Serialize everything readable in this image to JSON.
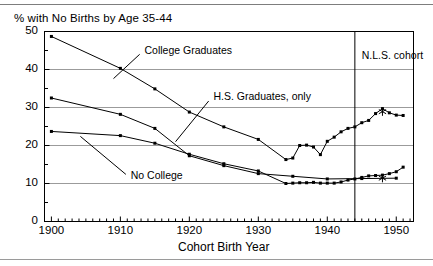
{
  "chart_data": {
    "type": "line",
    "title": "% with No Births by Age 35-44",
    "xlabel": "Cohort Birth Year",
    "ylabel": "",
    "xlim": [
      1899,
      1952.5
    ],
    "ylim": [
      0,
      50
    ],
    "grid": true,
    "grid_axis": "y",
    "yticks": [
      0,
      10,
      20,
      30,
      40,
      50
    ],
    "ytick_labels": [
      "0",
      "10",
      "20",
      "30",
      "40",
      "50"
    ],
    "yminor_step": 5,
    "xticks": [
      1900,
      1910,
      1920,
      1930,
      1940,
      1950
    ],
    "xtick_labels": [
      "1900",
      "1910",
      "1920",
      "1930",
      "1940",
      "1950"
    ],
    "xminor_step": 1,
    "legend": "none",
    "series": [
      {
        "name": "College Graduates",
        "marker": "square",
        "x": [
          1900,
          1910,
          1915,
          1920,
          1925,
          1930,
          1934,
          1935,
          1936,
          1937,
          1938,
          1939,
          1940,
          1941,
          1942,
          1943,
          1944,
          1945,
          1946,
          1947,
          1948,
          1949,
          1950,
          1951
        ],
        "y": [
          48.7,
          40.3,
          34.9,
          28.8,
          24.9,
          21.6,
          16.3,
          16.7,
          20.0,
          20.1,
          19.6,
          17.6,
          21.1,
          22.2,
          23.6,
          24.5,
          24.9,
          26.0,
          26.6,
          28.4,
          29.7,
          28.6,
          28.0,
          27.9
        ]
      },
      {
        "name": "H.S.  Graduates, only",
        "marker": "square",
        "x": [
          1900,
          1910,
          1915,
          1920,
          1925,
          1930,
          1935,
          1940,
          1945,
          1950
        ],
        "y": [
          32.5,
          28.2,
          24.5,
          17.3,
          14.7,
          12.6,
          11.9,
          11.2,
          11.3,
          11.4
        ]
      },
      {
        "name": "No College",
        "marker": "square",
        "x": [
          1900,
          1910,
          1915,
          1920,
          1925,
          1930,
          1934,
          1935,
          1936,
          1937,
          1938,
          1939,
          1940,
          1941,
          1942,
          1943,
          1944,
          1945,
          1946,
          1947,
          1948,
          1949,
          1950,
          1951
        ],
        "y": [
          23.7,
          22.6,
          20.6,
          17.7,
          15.2,
          13.3,
          10.0,
          10.1,
          10.2,
          10.2,
          10.3,
          10.1,
          10.1,
          10.1,
          10.4,
          10.9,
          11.2,
          11.6,
          12.0,
          12.1,
          12.2,
          12.6,
          13.1,
          14.3
        ]
      }
    ],
    "annotations": [
      {
        "name": "college-graduates-label",
        "text": "College Graduates",
        "x": 1913.5,
        "y": 45.0
      },
      {
        "name": "hs-graduates-label",
        "text": "H.S.  Graduates, only",
        "x": 1923.5,
        "y": 32.7
      },
      {
        "name": "no-college-label",
        "text": "No College",
        "x": 1911.5,
        "y": 11.9
      },
      {
        "name": "nls-cohort-label",
        "text": "N.L.S. cohort",
        "x": 1945.0,
        "y": 43.5
      }
    ],
    "vertical_rule": {
      "name": "nls-cohort-divider",
      "x": 1944
    },
    "star_markers": [
      {
        "series": "College Graduates",
        "x": 1948,
        "y": 29.7
      },
      {
        "series": "No College",
        "x": 1948,
        "y": 12.2
      }
    ],
    "colors": {
      "line": "#000000",
      "marker": "#000000",
      "grid": "#9b9b9b",
      "axis": "#000000",
      "background": "#ffffff"
    }
  }
}
